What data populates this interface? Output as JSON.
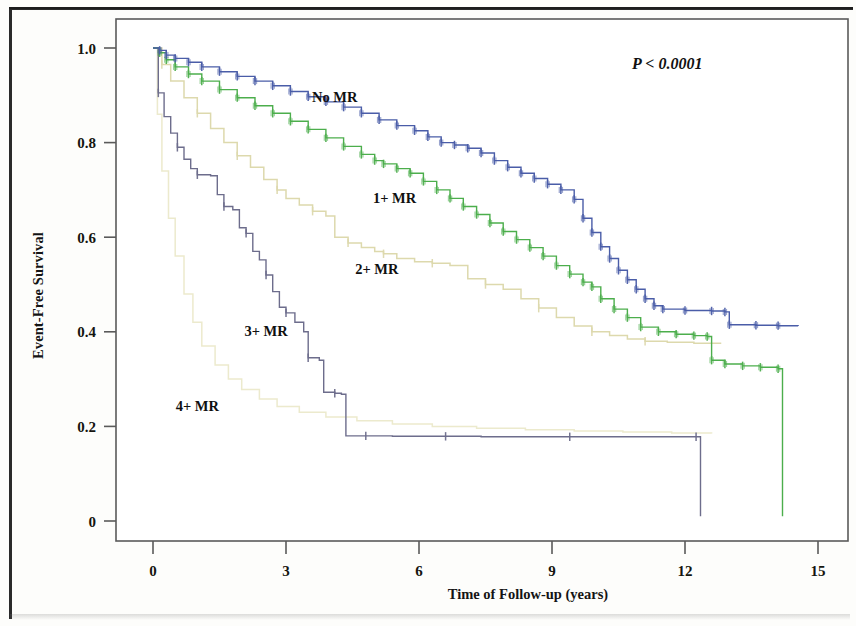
{
  "figure": {
    "y_axis_title": "Event-Free Survival",
    "x_axis_title": "Time of Follow-up (years)",
    "pvalue_annotation": "P < 0.0001"
  },
  "labels": {
    "no_mr": "No MR",
    "one_mr": "1+ MR",
    "two_mr": "2+ MR",
    "three_mr": "3+ MR",
    "four_mr": "4+ MR"
  },
  "ticks": {
    "y": [
      "1.0",
      "0.8",
      "0.6",
      "0.4",
      "0.2",
      "0"
    ],
    "x": [
      "0",
      "3",
      "6",
      "9",
      "12",
      "15"
    ]
  },
  "colors": {
    "no_mr": "#4a5da8",
    "one_mr": "#4cae4c",
    "two_mr": "#ddd9ad",
    "three_mr": "#6d6d8c",
    "four_mr": "#e9e6c4",
    "axis": "#5a5a5a",
    "text": "#141414"
  },
  "chart_data": {
    "type": "line",
    "title": "",
    "xlabel": "Time of Follow-up (years)",
    "ylabel": "Event-Free Survival",
    "xlim": [
      0,
      15
    ],
    "ylim": [
      0,
      1.0
    ],
    "xticks": [
      0,
      3,
      6,
      9,
      12,
      15
    ],
    "yticks": [
      0,
      0.2,
      0.4,
      0.6,
      0.8,
      1.0
    ],
    "grid": false,
    "legend": "inline-curve-labels",
    "annotations": [
      {
        "text": "P < 0.0001",
        "x": 11.6,
        "y": 0.955
      }
    ],
    "series": [
      {
        "name": "No MR",
        "color": "#4a5da8",
        "label_at": {
          "x": 4.1,
          "y": 0.885
        },
        "censor_marks": true,
        "points": [
          [
            0.0,
            1.0
          ],
          [
            0.15,
            0.995
          ],
          [
            0.3,
            0.985
          ],
          [
            0.5,
            0.978
          ],
          [
            0.8,
            0.97
          ],
          [
            1.1,
            0.96
          ],
          [
            1.5,
            0.95
          ],
          [
            1.9,
            0.94
          ],
          [
            2.3,
            0.93
          ],
          [
            2.7,
            0.92
          ],
          [
            3.1,
            0.908
          ],
          [
            3.5,
            0.897
          ],
          [
            3.9,
            0.886
          ],
          [
            4.3,
            0.875
          ],
          [
            4.7,
            0.862
          ],
          [
            5.1,
            0.848
          ],
          [
            5.5,
            0.836
          ],
          [
            5.9,
            0.825
          ],
          [
            6.2,
            0.812
          ],
          [
            6.5,
            0.8
          ],
          [
            6.8,
            0.795
          ],
          [
            7.1,
            0.788
          ],
          [
            7.4,
            0.778
          ],
          [
            7.7,
            0.762
          ],
          [
            8.0,
            0.748
          ],
          [
            8.3,
            0.735
          ],
          [
            8.6,
            0.724
          ],
          [
            8.9,
            0.712
          ],
          [
            9.2,
            0.7
          ],
          [
            9.5,
            0.68
          ],
          [
            9.7,
            0.64
          ],
          [
            9.9,
            0.61
          ],
          [
            10.1,
            0.58
          ],
          [
            10.3,
            0.555
          ],
          [
            10.5,
            0.53
          ],
          [
            10.7,
            0.51
          ],
          [
            10.9,
            0.49
          ],
          [
            11.1,
            0.47
          ],
          [
            11.3,
            0.455
          ],
          [
            11.5,
            0.448
          ],
          [
            12.0,
            0.445
          ],
          [
            12.6,
            0.444
          ],
          [
            12.9,
            0.442
          ],
          [
            13.0,
            0.415
          ],
          [
            13.6,
            0.414
          ],
          [
            14.1,
            0.413
          ],
          [
            14.55,
            0.412
          ]
        ]
      },
      {
        "name": "1+ MR",
        "color": "#4cae4c",
        "label_at": {
          "x": 5.45,
          "y": 0.672
        },
        "censor_marks": true,
        "points": [
          [
            0.0,
            1.0
          ],
          [
            0.15,
            0.99
          ],
          [
            0.3,
            0.975
          ],
          [
            0.5,
            0.96
          ],
          [
            0.8,
            0.945
          ],
          [
            1.1,
            0.93
          ],
          [
            1.5,
            0.912
          ],
          [
            1.9,
            0.895
          ],
          [
            2.3,
            0.878
          ],
          [
            2.7,
            0.862
          ],
          [
            3.1,
            0.845
          ],
          [
            3.5,
            0.828
          ],
          [
            3.9,
            0.81
          ],
          [
            4.3,
            0.792
          ],
          [
            4.7,
            0.775
          ],
          [
            5.0,
            0.762
          ],
          [
            5.2,
            0.755
          ],
          [
            5.5,
            0.745
          ],
          [
            5.8,
            0.735
          ],
          [
            6.1,
            0.718
          ],
          [
            6.4,
            0.7
          ],
          [
            6.7,
            0.682
          ],
          [
            7.0,
            0.665
          ],
          [
            7.3,
            0.648
          ],
          [
            7.6,
            0.63
          ],
          [
            7.9,
            0.612
          ],
          [
            8.2,
            0.595
          ],
          [
            8.5,
            0.578
          ],
          [
            8.8,
            0.56
          ],
          [
            9.1,
            0.54
          ],
          [
            9.4,
            0.522
          ],
          [
            9.7,
            0.505
          ],
          [
            9.9,
            0.495
          ],
          [
            10.1,
            0.47
          ],
          [
            10.4,
            0.448
          ],
          [
            10.7,
            0.43
          ],
          [
            11.0,
            0.41
          ],
          [
            11.4,
            0.4
          ],
          [
            11.8,
            0.395
          ],
          [
            12.2,
            0.392
          ],
          [
            12.5,
            0.39
          ],
          [
            12.6,
            0.34
          ],
          [
            12.9,
            0.332
          ],
          [
            13.3,
            0.328
          ],
          [
            13.7,
            0.325
          ],
          [
            14.1,
            0.322
          ],
          [
            14.2,
            0.01
          ]
        ]
      },
      {
        "name": "2+ MR",
        "color": "#ddd9ad",
        "label_at": {
          "x": 5.05,
          "y": 0.522
        },
        "censor_marks": true,
        "points": [
          [
            0.0,
            1.0
          ],
          [
            0.2,
            0.965
          ],
          [
            0.4,
            0.93
          ],
          [
            0.7,
            0.895
          ],
          [
            1.0,
            0.862
          ],
          [
            1.3,
            0.83
          ],
          [
            1.6,
            0.8
          ],
          [
            1.9,
            0.772
          ],
          [
            2.2,
            0.748
          ],
          [
            2.5,
            0.722
          ],
          [
            2.8,
            0.7
          ],
          [
            3.0,
            0.682
          ],
          [
            3.3,
            0.668
          ],
          [
            3.6,
            0.655
          ],
          [
            3.9,
            0.645
          ],
          [
            4.1,
            0.6
          ],
          [
            4.4,
            0.588
          ],
          [
            4.7,
            0.578
          ],
          [
            5.0,
            0.57
          ],
          [
            5.2,
            0.565
          ],
          [
            5.5,
            0.555
          ],
          [
            5.9,
            0.548
          ],
          [
            6.3,
            0.545
          ],
          [
            6.7,
            0.54
          ],
          [
            7.1,
            0.512
          ],
          [
            7.5,
            0.5
          ],
          [
            7.9,
            0.49
          ],
          [
            8.3,
            0.47
          ],
          [
            8.7,
            0.45
          ],
          [
            9.1,
            0.43
          ],
          [
            9.5,
            0.412
          ],
          [
            9.9,
            0.4
          ],
          [
            10.3,
            0.392
          ],
          [
            10.7,
            0.385
          ],
          [
            11.1,
            0.38
          ],
          [
            11.6,
            0.378
          ],
          [
            12.2,
            0.376
          ],
          [
            12.8,
            0.374
          ]
        ]
      },
      {
        "name": "3+ MR",
        "color": "#6d6d8c",
        "label_at": {
          "x": 2.55,
          "y": 0.392
        },
        "censor_marks": true,
        "points": [
          [
            0.0,
            1.0
          ],
          [
            0.12,
            0.905
          ],
          [
            0.25,
            0.855
          ],
          [
            0.4,
            0.82
          ],
          [
            0.55,
            0.79
          ],
          [
            0.7,
            0.765
          ],
          [
            0.85,
            0.745
          ],
          [
            1.0,
            0.732
          ],
          [
            1.3,
            0.73
          ],
          [
            1.45,
            0.69
          ],
          [
            1.6,
            0.665
          ],
          [
            1.8,
            0.658
          ],
          [
            1.95,
            0.62
          ],
          [
            2.1,
            0.608
          ],
          [
            2.25,
            0.57
          ],
          [
            2.4,
            0.552
          ],
          [
            2.55,
            0.52
          ],
          [
            2.7,
            0.485
          ],
          [
            2.85,
            0.452
          ],
          [
            3.0,
            0.44
          ],
          [
            3.2,
            0.42
          ],
          [
            3.4,
            0.4
          ],
          [
            3.5,
            0.345
          ],
          [
            3.75,
            0.34
          ],
          [
            3.85,
            0.272
          ],
          [
            4.1,
            0.27
          ],
          [
            4.25,
            0.268
          ],
          [
            4.35,
            0.18
          ],
          [
            4.8,
            0.18
          ],
          [
            5.4,
            0.179
          ],
          [
            6.0,
            0.179
          ],
          [
            6.6,
            0.179
          ],
          [
            7.4,
            0.178
          ],
          [
            8.4,
            0.178
          ],
          [
            9.4,
            0.178
          ],
          [
            10.4,
            0.178
          ],
          [
            11.4,
            0.178
          ],
          [
            12.25,
            0.178
          ],
          [
            12.35,
            0.01
          ]
        ]
      },
      {
        "name": "4+ MR",
        "color": "#e9e6c4",
        "label_at": {
          "x": 1.0,
          "y": 0.232
        },
        "censor_marks": false,
        "points": [
          [
            0.0,
            1.0
          ],
          [
            0.1,
            0.86
          ],
          [
            0.2,
            0.74
          ],
          [
            0.35,
            0.64
          ],
          [
            0.5,
            0.56
          ],
          [
            0.7,
            0.48
          ],
          [
            0.9,
            0.42
          ],
          [
            1.1,
            0.37
          ],
          [
            1.4,
            0.33
          ],
          [
            1.7,
            0.3
          ],
          [
            2.0,
            0.278
          ],
          [
            2.4,
            0.258
          ],
          [
            2.8,
            0.242
          ],
          [
            3.3,
            0.23
          ],
          [
            3.9,
            0.22
          ],
          [
            4.6,
            0.212
          ],
          [
            5.4,
            0.205
          ],
          [
            6.3,
            0.2
          ],
          [
            7.3,
            0.196
          ],
          [
            8.4,
            0.193
          ],
          [
            9.5,
            0.19
          ],
          [
            10.6,
            0.188
          ],
          [
            11.7,
            0.186
          ],
          [
            12.6,
            0.185
          ]
        ]
      }
    ]
  }
}
